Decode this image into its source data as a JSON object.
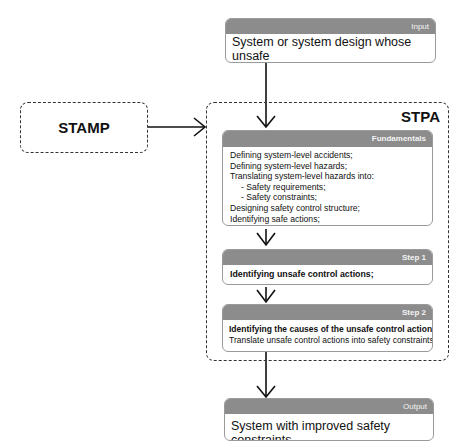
{
  "input": {
    "label": "Input",
    "text_lines": [
      "System or system design whose unsafe",
      "behaviour needs to be identified"
    ]
  },
  "stamp": {
    "title": "STAMP"
  },
  "stpa": {
    "title": "STPA",
    "fundamentals": {
      "label": "Fundamentals",
      "lines": [
        {
          "text": "Defining system-level accidents;",
          "indent": false
        },
        {
          "text": "Defining system-level hazards;",
          "indent": false
        },
        {
          "text": "Translating system-level hazards into:",
          "indent": false
        },
        {
          "text": "- Safety requirements;",
          "indent": true
        },
        {
          "text": "- Safety constraints;",
          "indent": true
        },
        {
          "text": "Designing safety control structure;",
          "indent": false
        },
        {
          "text": "Identifying safe actions;",
          "indent": false
        }
      ]
    },
    "step1": {
      "label": "Step 1",
      "lines": [
        {
          "text": "Identifying unsafe control actions;",
          "bold": true
        }
      ]
    },
    "step2": {
      "label": "Step 2",
      "lines": [
        {
          "text": "Identifying the causes of the unsafe control actions;",
          "bold": true
        },
        {
          "text": "Translate unsafe control actions into safety constraints;",
          "bold": false
        }
      ]
    }
  },
  "output": {
    "label": "Output",
    "text": "System with improved safety constraints"
  },
  "colors": {
    "header_gray": "#8c8c8c",
    "border": "#9a9a9a",
    "line": "#111111"
  }
}
